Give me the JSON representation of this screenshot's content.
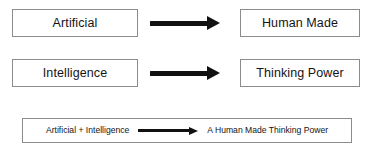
{
  "diagram": {
    "background_color": "#ffffff",
    "box_border_color": "#8c8c8c",
    "arrow_color": "#111111",
    "text_color": "#141414",
    "rows": [
      {
        "source_label": "Artificial",
        "arrow_icon": "right-arrow-icon",
        "target_label": "Human Made"
      },
      {
        "source_label": "Intelligence",
        "arrow_icon": "right-arrow-icon",
        "target_label": "Thinking Power"
      }
    ],
    "summary": {
      "source_label": "Artificial + Intelligence",
      "arrow_icon": "right-arrow-icon",
      "target_label": "A Human Made Thinking Power"
    }
  }
}
